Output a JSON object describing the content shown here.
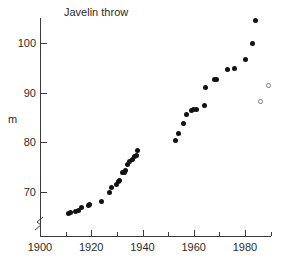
{
  "chart_data": {
    "type": "scatter",
    "title": "Javelin throw",
    "xlabel": "",
    "ylabel": "m",
    "xlim": [
      1900,
      1990
    ],
    "ylim": [
      64.5,
      106
    ],
    "grid": false,
    "legend": null,
    "axis_break": {
      "axis": "y",
      "note": "zigzag break on y-axis below lowest data"
    },
    "xticks": [
      1900,
      1920,
      1940,
      1960,
      1980
    ],
    "xticks_minor": [
      1910,
      1930,
      1950,
      1970,
      1990
    ],
    "yticks": [
      70,
      80,
      90,
      100
    ],
    "series": [
      {
        "name": "World record (old javelin)",
        "marker": "filled-circle",
        "color": "#111111",
        "points": [
          {
            "x": 1911,
            "y": 65.7
          },
          {
            "x": 1912,
            "y": 65.8
          },
          {
            "x": 1914,
            "y": 66.1
          },
          {
            "x": 1915,
            "y": 66.2
          },
          {
            "x": 1916,
            "y": 66.9
          },
          {
            "x": 1919,
            "y": 67.3
          },
          {
            "x": 1919.5,
            "y": 67.5
          },
          {
            "x": 1924,
            "y": 68.0
          },
          {
            "x": 1927,
            "y": 69.9
          },
          {
            "x": 1928,
            "y": 71.0
          },
          {
            "x": 1930,
            "y": 71.6
          },
          {
            "x": 1930.5,
            "y": 72.2
          },
          {
            "x": 1931,
            "y": 72.4
          },
          {
            "x": 1932,
            "y": 73.9
          },
          {
            "x": 1933,
            "y": 74.0
          },
          {
            "x": 1933.5,
            "y": 74.3
          },
          {
            "x": 1934,
            "y": 75.5
          },
          {
            "x": 1935,
            "y": 76.1
          },
          {
            "x": 1936,
            "y": 76.6
          },
          {
            "x": 1937,
            "y": 77.2
          },
          {
            "x": 1937.5,
            "y": 77.3
          },
          {
            "x": 1938,
            "y": 78.3
          },
          {
            "x": 1953,
            "y": 80.4
          },
          {
            "x": 1954,
            "y": 81.8
          },
          {
            "x": 1956,
            "y": 83.7
          },
          {
            "x": 1957,
            "y": 85.7
          },
          {
            "x": 1959,
            "y": 86.5
          },
          {
            "x": 1960,
            "y": 86.6
          },
          {
            "x": 1961,
            "y": 86.7
          },
          {
            "x": 1964,
            "y": 87.4
          },
          {
            "x": 1964.5,
            "y": 91.0
          },
          {
            "x": 1968,
            "y": 92.6
          },
          {
            "x": 1969,
            "y": 92.7
          },
          {
            "x": 1973,
            "y": 94.6
          },
          {
            "x": 1976,
            "y": 94.8
          },
          {
            "x": 1980,
            "y": 96.7
          },
          {
            "x": 1983,
            "y": 99.9
          },
          {
            "x": 1984,
            "y": 104.6
          }
        ]
      },
      {
        "name": "New javelin specification",
        "marker": "open-circle",
        "color": "#7b7b7b",
        "points": [
          {
            "x": 1986,
            "y": 88.2
          },
          {
            "x": 1989,
            "y": 91.5
          }
        ]
      }
    ]
  },
  "axes": {
    "y_axis_name": "m",
    "x_tick_labels": [
      "1900",
      "1920",
      "1940",
      "1960",
      "1980"
    ],
    "y_tick_labels": [
      "70",
      "80",
      "90",
      "100"
    ]
  }
}
